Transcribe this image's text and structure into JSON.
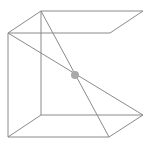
{
  "diagram": {
    "type": "wireframe-cube",
    "colors": {
      "background": "#ffffff",
      "edge": "#8a8a8a",
      "center_dot": "#a9a9a9"
    },
    "vertices": {
      "front_top_left": [
        8,
        33
      ],
      "front_bottom_left": [
        8,
        137
      ],
      "front_top_right": [
        110,
        33
      ],
      "front_bottom_right": [
        109,
        137
      ],
      "back_top_left": [
        41,
        11
      ],
      "back_top_right": [
        143,
        11
      ],
      "back_bottom_left": [
        41,
        115
      ],
      "back_bottom_right": [
        143,
        115
      ]
    },
    "center_point": {
      "x": 75,
      "y": 75,
      "r": 4
    }
  }
}
